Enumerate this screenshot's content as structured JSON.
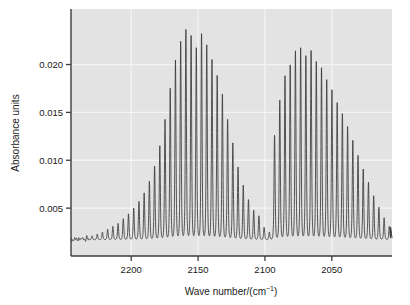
{
  "figure": {
    "background_color": "#ffffff",
    "plot_background_color": "#e3e3e3",
    "grid_color": "#f4f4f4",
    "axis_color": "#3c3c3c",
    "trace_color": "#3a3a3a"
  },
  "axes": {
    "x_title_main": "Wave number/(cm",
    "x_title_sup": "−1",
    "x_title_tail": ")",
    "x_title_full": "Wave number/(cm⁻¹)",
    "y_title": "Absorbance units",
    "x_ticks": [
      {
        "label": "2200",
        "value": 2200
      },
      {
        "label": "2150",
        "value": 2150
      },
      {
        "label": "2100",
        "value": 2100
      },
      {
        "label": "2050",
        "value": 2050
      }
    ],
    "y_ticks": [
      {
        "label": "0.005",
        "value": 0.005
      },
      {
        "label": "0.010",
        "value": 0.01
      },
      {
        "label": "0.015",
        "value": 0.015
      },
      {
        "label": "0.020",
        "value": 0.02
      }
    ]
  },
  "chart_data": {
    "type": "line",
    "title": "",
    "subtitle": "",
    "xlabel": "Wave number/(cm⁻¹)",
    "ylabel": "Absorbance units",
    "xlim": [
      2245,
      2005
    ],
    "ylim": [
      0,
      0.0258
    ],
    "x_inverted": true,
    "grid": true,
    "legend": null,
    "annotations": [],
    "line_spacing_cm1": 3.9,
    "baseline": 0.0017,
    "band_origin": 2143,
    "branches": [
      {
        "name": "R branch",
        "peak_wavenumber": 2172,
        "peak_absorbance": 0.0237
      },
      {
        "name": "P branch",
        "peak_wavenumber": 2118,
        "peak_absorbance": 0.0218
      }
    ],
    "peaks": [
      {
        "x": 2241.0,
        "y": 0.0019
      },
      {
        "x": 2237.1,
        "y": 0.002
      },
      {
        "x": 2233.2,
        "y": 0.002
      },
      {
        "x": 2229.3,
        "y": 0.0021
      },
      {
        "x": 2225.4,
        "y": 0.0023
      },
      {
        "x": 2221.5,
        "y": 0.0025
      },
      {
        "x": 2217.6,
        "y": 0.0028
      },
      {
        "x": 2213.7,
        "y": 0.0031
      },
      {
        "x": 2209.8,
        "y": 0.0034
      },
      {
        "x": 2205.9,
        "y": 0.0039
      },
      {
        "x": 2202.0,
        "y": 0.0044
      },
      {
        "x": 2198.1,
        "y": 0.005
      },
      {
        "x": 2194.2,
        "y": 0.0057
      },
      {
        "x": 2190.3,
        "y": 0.0066
      },
      {
        "x": 2186.4,
        "y": 0.0078
      },
      {
        "x": 2182.5,
        "y": 0.0094
      },
      {
        "x": 2178.6,
        "y": 0.0115
      },
      {
        "x": 2174.7,
        "y": 0.0143
      },
      {
        "x": 2170.8,
        "y": 0.0175
      },
      {
        "x": 2166.9,
        "y": 0.0205
      },
      {
        "x": 2163.0,
        "y": 0.0224
      },
      {
        "x": 2159.1,
        "y": 0.0237
      },
      {
        "x": 2155.2,
        "y": 0.023
      },
      {
        "x": 2151.3,
        "y": 0.0218
      },
      {
        "x": 2147.4,
        "y": 0.0232
      },
      {
        "x": 2143.5,
        "y": 0.0221
      },
      {
        "x": 2139.6,
        "y": 0.0205
      },
      {
        "x": 2135.7,
        "y": 0.0189
      },
      {
        "x": 2131.8,
        "y": 0.0169
      },
      {
        "x": 2127.9,
        "y": 0.0143
      },
      {
        "x": 2124.0,
        "y": 0.0118
      },
      {
        "x": 2120.1,
        "y": 0.0093
      },
      {
        "x": 2116.2,
        "y": 0.0074
      },
      {
        "x": 2112.3,
        "y": 0.0059
      },
      {
        "x": 2108.4,
        "y": 0.0048
      },
      {
        "x": 2104.5,
        "y": 0.0042
      },
      {
        "x": 2100.6,
        "y": 0.003
      },
      {
        "x": 2096.7,
        "y": 0.0025
      },
      {
        "x": 2092.8,
        "y": 0.0126
      },
      {
        "x": 2088.9,
        "y": 0.0163
      },
      {
        "x": 2085.0,
        "y": 0.0188
      },
      {
        "x": 2081.1,
        "y": 0.02
      },
      {
        "x": 2077.2,
        "y": 0.0214
      },
      {
        "x": 2073.3,
        "y": 0.0218
      },
      {
        "x": 2069.4,
        "y": 0.0209
      },
      {
        "x": 2065.5,
        "y": 0.0215
      },
      {
        "x": 2061.6,
        "y": 0.0203
      },
      {
        "x": 2057.7,
        "y": 0.0197
      },
      {
        "x": 2053.8,
        "y": 0.0184
      },
      {
        "x": 2049.9,
        "y": 0.0174
      },
      {
        "x": 2046.0,
        "y": 0.016
      },
      {
        "x": 2042.1,
        "y": 0.0149
      },
      {
        "x": 2038.2,
        "y": 0.0135
      },
      {
        "x": 2034.3,
        "y": 0.0121
      },
      {
        "x": 2030.4,
        "y": 0.0105
      },
      {
        "x": 2026.5,
        "y": 0.0091
      },
      {
        "x": 2022.6,
        "y": 0.0077
      },
      {
        "x": 2018.7,
        "y": 0.0063
      },
      {
        "x": 2014.8,
        "y": 0.0051
      },
      {
        "x": 2010.9,
        "y": 0.004
      },
      {
        "x": 2007.0,
        "y": 0.0031
      }
    ],
    "tail_noise": [
      0.003,
      0.0026,
      0.0029,
      0.0023,
      0.0026,
      0.0022,
      0.0024,
      0.0021,
      0.0023,
      0.002,
      0.0022,
      0.0019
    ]
  }
}
